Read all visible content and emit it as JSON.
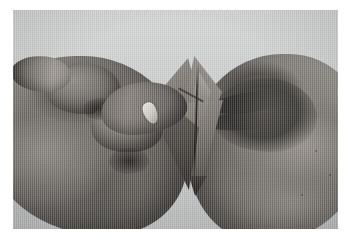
{
  "page": {
    "background_color": "#ffffff",
    "type": "photograph-figure"
  },
  "photo": {
    "name": "origami-folding-photograph",
    "alt_text": "Black and white photograph of two hands folding a sheet of paper into a narrow diamond (kite) origami shape",
    "subject": "hands folding origami paper",
    "color_mode": "grayscale",
    "background_color": "#cfd0d0",
    "frame": {
      "left": 13,
      "top": 10,
      "width": 325,
      "height": 219
    },
    "elements": {
      "left_hand": {
        "label": "left hand",
        "description": "Left hand seen from the side, knuckles raised, index finger reaching in to pinch the paper"
      },
      "right_hand": {
        "label": "right hand",
        "description": "Right hand loosely closed into a fist with the thumb extended toward the paper"
      },
      "origami": {
        "label": "origami model",
        "description": "Folded paper diamond with a vertical centre crease, tapering to a sharp point at the bottom",
        "shape": "diamond / kite"
      },
      "fingernail_highlight": {
        "label": "fingernail",
        "description": "Bright specular highlight on the left index fingernail"
      },
      "shadow": {
        "label": "cast shadow",
        "description": "Soft shadow under the paper point on the table surface"
      }
    },
    "tones": {
      "background_paper": "#d3d4d4",
      "skin_light": "#97928c",
      "skin_mid": "#726e69",
      "skin_dark": "#4a4744",
      "origami_light": "#9a958f",
      "origami_dark": "#2b2927"
    }
  }
}
